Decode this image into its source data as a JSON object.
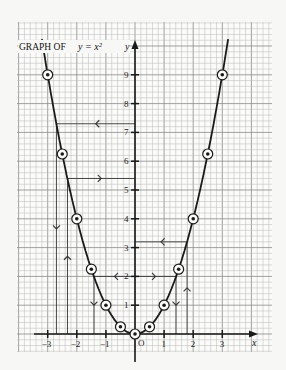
{
  "chart_data": {
    "type": "line",
    "title": "GRAPH OF y = x²",
    "title_prefix": "GRAPH OF",
    "title_equation": "y = x²",
    "xlabel": "x",
    "ylabel": "y",
    "origin_label": "O",
    "xlim": [
      -4,
      4.5
    ],
    "ylim": [
      -0.5,
      10.8
    ],
    "grid": true,
    "x_ticks": [
      -3,
      -2,
      -1,
      1,
      2,
      3
    ],
    "x_tick_labels": [
      "−3",
      "−2",
      "−1",
      "1",
      "2",
      "3"
    ],
    "y_ticks": [
      1,
      2,
      3,
      4,
      5,
      6,
      7,
      8,
      9
    ],
    "y_tick_labels": [
      "1",
      "2",
      "3",
      "4",
      "5",
      "6",
      "7",
      "8",
      "9"
    ],
    "series": [
      {
        "name": "y = x²",
        "x": [
          -3,
          -2.5,
          -2,
          -1.5,
          -1,
          -0.5,
          0,
          0.5,
          1,
          1.5,
          2,
          2.5,
          3
        ],
        "y": [
          9,
          6.25,
          4,
          2.25,
          1,
          0.25,
          0,
          0.25,
          1,
          2.25,
          4,
          6.25,
          9
        ],
        "marker": "circled-dot"
      }
    ],
    "annotations": [
      {
        "type": "reading-line",
        "from": [
          -2.7,
          7.3
        ],
        "to": [
          0,
          7.3
        ],
        "arrow": "left",
        "note": "horizontal at y≈7.3"
      },
      {
        "type": "reading-line",
        "from": [
          -2.7,
          7.3
        ],
        "to": [
          -2.7,
          0
        ],
        "arrow": "down",
        "note": "x≈-2.7"
      },
      {
        "type": "reading-line",
        "from": [
          0,
          5.4
        ],
        "to": [
          -2.32,
          5.4
        ],
        "arrow": "right",
        "note": "horizontal at y≈5.4"
      },
      {
        "type": "reading-line",
        "from": [
          -2.32,
          0
        ],
        "to": [
          -2.32,
          5.4
        ],
        "arrow": "up",
        "note": "x≈-2.32"
      },
      {
        "type": "reading-line",
        "from": [
          0,
          2
        ],
        "to": [
          -1.41,
          2
        ],
        "arrow": "left",
        "note": "y=2"
      },
      {
        "type": "reading-line",
        "from": [
          -1.41,
          2
        ],
        "to": [
          -1.41,
          0
        ],
        "arrow": "down",
        "note": "x≈-1.41"
      },
      {
        "type": "reading-line",
        "from": [
          0,
          3.2
        ],
        "to": [
          1.79,
          3.2
        ],
        "arrow": "left",
        "note": "y≈3.2"
      },
      {
        "type": "reading-line",
        "from": [
          1.79,
          0
        ],
        "to": [
          1.79,
          3.2
        ],
        "arrow": "up",
        "note": "x≈1.79"
      },
      {
        "type": "reading-line",
        "from": [
          0,
          2
        ],
        "to": [
          1.41,
          2
        ],
        "arrow": "right",
        "note": "y=2"
      },
      {
        "type": "reading-line",
        "from": [
          1.41,
          2
        ],
        "to": [
          1.41,
          0
        ],
        "arrow": "down",
        "note": "x≈1.41"
      }
    ]
  },
  "colors": {
    "background": "#f7f7f5",
    "grid_minor": "#b8b8b8",
    "grid_major": "#8a8a8a",
    "ink": "#1a1a1a"
  }
}
